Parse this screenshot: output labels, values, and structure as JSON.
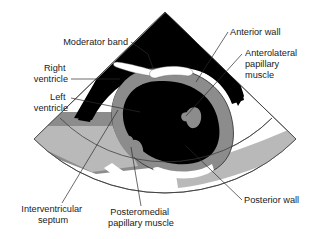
{
  "figure": {
    "view_type": "ultrasound sector scan",
    "background_color": "#ffffff"
  },
  "palette": {
    "chamber_black": "#000000",
    "myocardium_gray": "#8c8c8c",
    "tissue_light_gray": "#b9b9b9",
    "highlight_white": "#ffffff",
    "outline_gray": "#3a3a3a",
    "text_color": "#1a1a1a"
  },
  "structures": [
    {
      "id": "sector-field",
      "name": "ultrasound-sector-field",
      "fill": "#ffffff",
      "stroke": "#3a3a3a"
    },
    {
      "id": "right-ventricle",
      "name": "right-ventricle-cavity",
      "fill": "#000000"
    },
    {
      "id": "left-ventricle",
      "name": "left-ventricle-cavity",
      "fill": "#000000"
    },
    {
      "id": "myocardium",
      "name": "left-ventricle-myocardial-wall",
      "fill": "#8c8c8c"
    },
    {
      "id": "moderator-band",
      "name": "moderator-band",
      "fill": "#ffffff"
    },
    {
      "id": "anterolateral-papillary",
      "name": "anterolateral-papillary-muscle",
      "fill": "#8c8c8c"
    },
    {
      "id": "posteromedial-papillary",
      "name": "posteromedial-papillary-muscle",
      "fill": "#8c8c8c"
    },
    {
      "id": "near-field-tissue-left",
      "name": "near-field-tissue-wedge-left",
      "fill": "#8c8c8c"
    },
    {
      "id": "far-field-tissue-right",
      "name": "far-field-tissue-band-right",
      "fill": "#b9b9b9"
    }
  ],
  "labels": [
    {
      "id": "moderator-band",
      "lines": [
        "Moderator band"
      ],
      "text": "Moderator band",
      "anchor": "end",
      "x": 128,
      "y": 45,
      "leader": "M131,42 L148,54 L153,68"
    },
    {
      "id": "right-ventricle",
      "lines": [
        "Right",
        "ventricle"
      ],
      "text": "Right ventricle",
      "anchor": "end",
      "x": 68,
      "y": 71,
      "leader": "M71,79 L120,79"
    },
    {
      "id": "left-ventricle",
      "lines": [
        "Left",
        "ventricle"
      ],
      "text": "Left ventricle",
      "anchor": "end",
      "x": 68,
      "y": 100,
      "leader": "M71,98 L140,112"
    },
    {
      "id": "interventricular-septum",
      "lines": [
        "Interventricular",
        "septum"
      ],
      "text": "Interventricular septum",
      "anchor": "middle",
      "x": 53,
      "y": 212,
      "leader": "M62,203 L118,110"
    },
    {
      "id": "posteromedial-papillary-muscle",
      "lines": [
        "Posteromedial",
        "papillary muscle"
      ],
      "text": "Posteromedial papillary muscle",
      "anchor": "middle",
      "x": 141,
      "y": 215,
      "leader": "M141,206 L130,148"
    },
    {
      "id": "anterior-wall",
      "lines": [
        "Anterior wall"
      ],
      "text": "Anterior wall",
      "anchor": "start",
      "x": 230,
      "y": 35,
      "leader": "M228,32 L196,82"
    },
    {
      "id": "anterolateral-papillary-muscle",
      "lines": [
        "Anterolateral",
        "papillary",
        "muscle"
      ],
      "text": "Anterolateral papillary muscle",
      "anchor": "start",
      "x": 245,
      "y": 56,
      "leader": "M242,54 L183,114"
    },
    {
      "id": "posterior-wall",
      "lines": [
        "Posterior wall"
      ],
      "text": "Posterior wall",
      "anchor": "start",
      "x": 244,
      "y": 203,
      "leader": "M242,200 L187,146"
    }
  ]
}
